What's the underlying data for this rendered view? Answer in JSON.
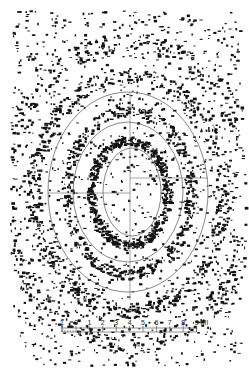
{
  "figure": {
    "background": "#ffffff",
    "ink": "#111111",
    "line_color": "#555555",
    "center": [
      130,
      180
    ],
    "rings": [
      {
        "name": "outer-ring",
        "rx": 80,
        "ry": 100,
        "cx": 128,
        "cy": 192
      },
      {
        "name": "middle-ring",
        "rx": 55,
        "ry": 70,
        "cx": 128,
        "cy": 192
      },
      {
        "name": "inner-ring",
        "rx": 29,
        "ry": 44,
        "cx": 132,
        "cy": 192
      }
    ],
    "speckle_bands": [
      {
        "cx": 128,
        "cy": 192,
        "rx": 38,
        "ry": 52,
        "w": 8,
        "density": 0.55
      },
      {
        "cx": 128,
        "cy": 192,
        "rx": 62,
        "ry": 82,
        "w": 10,
        "density": 0.45
      },
      {
        "cx": 128,
        "cy": 192,
        "rx": 95,
        "ry": 118,
        "w": 14,
        "density": 0.6
      },
      {
        "cx": 128,
        "cy": 192,
        "rx": 125,
        "ry": 150,
        "w": 18,
        "density": 0.55
      }
    ]
  },
  "scale_bar": {
    "x0": 62,
    "x_zero": 76,
    "step": 13.4,
    "y": 330,
    "labels": [
      "1",
      "0",
      "1",
      "2",
      "3",
      "4",
      "5",
      "6",
      "7",
      "8",
      "9"
    ],
    "unit": "MI"
  }
}
